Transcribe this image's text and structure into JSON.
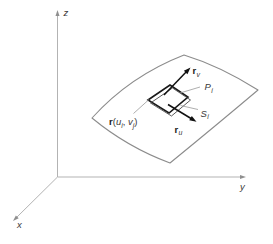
{
  "figure": {
    "axis_labels": {
      "x": "x",
      "y": "y",
      "z": "z"
    },
    "vector_labels": {
      "rv": {
        "base": "r",
        "sub": "v"
      },
      "ru": {
        "base": "r",
        "sub": "u"
      }
    },
    "patch_labels": {
      "tangent_parallelogram": {
        "base": "P",
        "sub": "i"
      },
      "surface_patch": {
        "base": "S",
        "sub": "i"
      }
    },
    "position_label": {
      "r": "r",
      "open": "(",
      "u": "u",
      "sub_u": "i",
      "comma": ",",
      "v": "v",
      "sub_v": "j",
      "close": ")"
    },
    "colors": {
      "ink": "#1a1a1a",
      "surface_line": "#8c8c8c",
      "axis_line": "#b3b3b3",
      "leader_line": "#999999",
      "thin_patch_line": "#4a4a4a",
      "label_text": "#3a3a3a"
    }
  }
}
